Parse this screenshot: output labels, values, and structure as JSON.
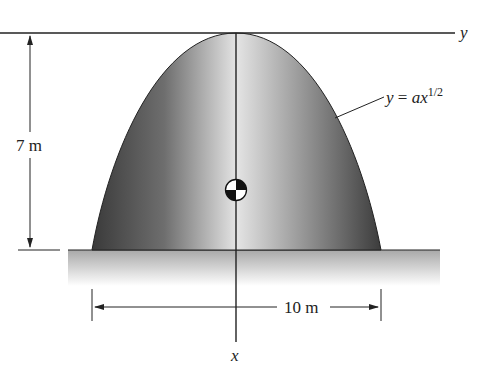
{
  "figure": {
    "axes": {
      "y_axis_label": "y",
      "x_axis_label": "x"
    },
    "curve_equation": {
      "lhs": "y",
      "equals": " = ",
      "coef": "ax",
      "exponent": "1/2"
    },
    "dimensions": {
      "height": "7 m",
      "base_width": "10 m"
    },
    "colors": {
      "shape_dark": "#3a3a3a",
      "shape_light": "#e0e0e0",
      "ground_top": "#a8a8a8",
      "ground_bottom": "#ffffff",
      "line": "#222222"
    }
  }
}
